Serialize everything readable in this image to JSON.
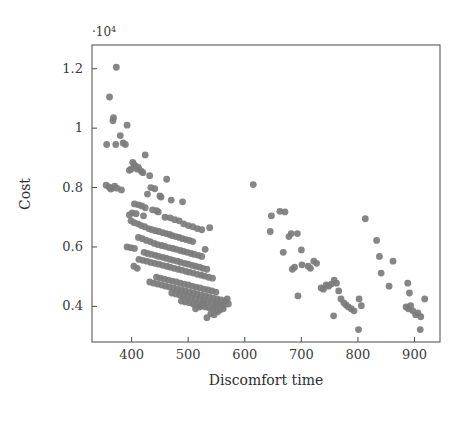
{
  "chart_data": {
    "type": "scatter",
    "title": "",
    "xlabel": "Discomfort time",
    "ylabel": "Cost",
    "y_exponent_label": "·10",
    "y_exponent_power": "4",
    "y_scale_factor": 10000,
    "xlim": [
      330,
      945
    ],
    "ylim": [
      0.28,
      1.28
    ],
    "xticks": [
      400,
      500,
      600,
      700,
      800,
      900
    ],
    "xtick_labels": [
      "400",
      "500",
      "600",
      "700",
      "800",
      "900"
    ],
    "yticks": [
      0.4,
      0.6,
      0.8,
      1,
      1.2
    ],
    "ytick_labels": [
      "0.4",
      "0.6",
      "0.8",
      "1",
      "1.2"
    ],
    "grid": false,
    "legend": false,
    "marker": {
      "shape": "circle",
      "color": "#7c7c7c",
      "radius": 3.4,
      "opacity": 0.92
    },
    "series": [
      {
        "name": "Pareto solutions",
        "points": [
          [
            373,
            1.205
          ],
          [
            361,
            1.105
          ],
          [
            368,
            1.035
          ],
          [
            367,
            1.025
          ],
          [
            392,
            1.01
          ],
          [
            380,
            0.975
          ],
          [
            356,
            0.945
          ],
          [
            372,
            0.945
          ],
          [
            385,
            0.95
          ],
          [
            389,
            0.945
          ],
          [
            424,
            0.91
          ],
          [
            402,
            0.885
          ],
          [
            404,
            0.878
          ],
          [
            407,
            0.872
          ],
          [
            412,
            0.868
          ],
          [
            410,
            0.862
          ],
          [
            399,
            0.862
          ],
          [
            396,
            0.858
          ],
          [
            417,
            0.855
          ],
          [
            420,
            0.85
          ],
          [
            432,
            0.84
          ],
          [
            462,
            0.828
          ],
          [
            355,
            0.808
          ],
          [
            360,
            0.802
          ],
          [
            366,
            0.798
          ],
          [
            370,
            0.805
          ],
          [
            374,
            0.798
          ],
          [
            363,
            0.795
          ],
          [
            382,
            0.792
          ],
          [
            434,
            0.8
          ],
          [
            441,
            0.796
          ],
          [
            615,
            0.81
          ],
          [
            428,
            0.778
          ],
          [
            450,
            0.772
          ],
          [
            452,
            0.768
          ],
          [
            470,
            0.758
          ],
          [
            490,
            0.752
          ],
          [
            405,
            0.745
          ],
          [
            412,
            0.742
          ],
          [
            418,
            0.738
          ],
          [
            424,
            0.732
          ],
          [
            437,
            0.725
          ],
          [
            444,
            0.722
          ],
          [
            447,
            0.718
          ],
          [
            401,
            0.715
          ],
          [
            408,
            0.712
          ],
          [
            396,
            0.708
          ],
          [
            421,
            0.705
          ],
          [
            459,
            0.7
          ],
          [
            468,
            0.698
          ],
          [
            476,
            0.692
          ],
          [
            484,
            0.688
          ],
          [
            492,
            0.678
          ],
          [
            500,
            0.672
          ],
          [
            508,
            0.668
          ],
          [
            516,
            0.662
          ],
          [
            524,
            0.658
          ],
          [
            538,
            0.665
          ],
          [
            647,
            0.705
          ],
          [
            662,
            0.72
          ],
          [
            671,
            0.718
          ],
          [
            813,
            0.695
          ],
          [
            399,
            0.688
          ],
          [
            404,
            0.682
          ],
          [
            411,
            0.678
          ],
          [
            417,
            0.672
          ],
          [
            423,
            0.668
          ],
          [
            430,
            0.662
          ],
          [
            436,
            0.658
          ],
          [
            442,
            0.655
          ],
          [
            448,
            0.652
          ],
          [
            455,
            0.648
          ],
          [
            461,
            0.645
          ],
          [
            467,
            0.642
          ],
          [
            472,
            0.638
          ],
          [
            478,
            0.635
          ],
          [
            484,
            0.632
          ],
          [
            490,
            0.628
          ],
          [
            496,
            0.625
          ],
          [
            502,
            0.622
          ],
          [
            508,
            0.618
          ],
          [
            412,
            0.632
          ],
          [
            419,
            0.628
          ],
          [
            426,
            0.622
          ],
          [
            433,
            0.618
          ],
          [
            440,
            0.612
          ],
          [
            446,
            0.608
          ],
          [
            453,
            0.605
          ],
          [
            459,
            0.602
          ],
          [
            466,
            0.598
          ],
          [
            473,
            0.595
          ],
          [
            479,
            0.592
          ],
          [
            486,
            0.588
          ],
          [
            492,
            0.585
          ],
          [
            498,
            0.582
          ],
          [
            505,
            0.578
          ],
          [
            511,
            0.575
          ],
          [
            518,
            0.572
          ],
          [
            524,
            0.568
          ],
          [
            392,
            0.6
          ],
          [
            398,
            0.598
          ],
          [
            405,
            0.595
          ],
          [
            530,
            0.592
          ],
          [
            645,
            0.652
          ],
          [
            678,
            0.635
          ],
          [
            682,
            0.645
          ],
          [
            668,
            0.582
          ],
          [
            422,
            0.582
          ],
          [
            428,
            0.578
          ],
          [
            435,
            0.575
          ],
          [
            442,
            0.572
          ],
          [
            448,
            0.568
          ],
          [
            455,
            0.565
          ],
          [
            461,
            0.562
          ],
          [
            468,
            0.558
          ],
          [
            474,
            0.555
          ],
          [
            481,
            0.552
          ],
          [
            487,
            0.548
          ],
          [
            494,
            0.545
          ],
          [
            500,
            0.542
          ],
          [
            507,
            0.538
          ],
          [
            513,
            0.535
          ],
          [
            520,
            0.532
          ],
          [
            526,
            0.528
          ],
          [
            533,
            0.525
          ],
          [
            413,
            0.558
          ],
          [
            420,
            0.555
          ],
          [
            427,
            0.552
          ],
          [
            434,
            0.548
          ],
          [
            441,
            0.545
          ],
          [
            448,
            0.542
          ],
          [
            455,
            0.538
          ],
          [
            462,
            0.535
          ],
          [
            468,
            0.532
          ],
          [
            475,
            0.528
          ],
          [
            482,
            0.525
          ],
          [
            489,
            0.522
          ],
          [
            496,
            0.518
          ],
          [
            502,
            0.515
          ],
          [
            509,
            0.512
          ],
          [
            516,
            0.508
          ],
          [
            523,
            0.505
          ],
          [
            529,
            0.502
          ],
          [
            536,
            0.498
          ],
          [
            543,
            0.495
          ],
          [
            404,
            0.535
          ],
          [
            410,
            0.528
          ],
          [
            700,
            0.59
          ],
          [
            722,
            0.552
          ],
          [
            727,
            0.545
          ],
          [
            693,
            0.645
          ],
          [
            701,
            0.54
          ],
          [
            712,
            0.535
          ],
          [
            716,
            0.528
          ],
          [
            688,
            0.532
          ],
          [
            684,
            0.525
          ],
          [
            838,
            0.568
          ],
          [
            862,
            0.552
          ],
          [
            833,
            0.622
          ],
          [
            841,
            0.512
          ],
          [
            444,
            0.498
          ],
          [
            451,
            0.495
          ],
          [
            458,
            0.492
          ],
          [
            465,
            0.488
          ],
          [
            472,
            0.485
          ],
          [
            479,
            0.482
          ],
          [
            486,
            0.478
          ],
          [
            493,
            0.475
          ],
          [
            500,
            0.472
          ],
          [
            507,
            0.468
          ],
          [
            514,
            0.465
          ],
          [
            521,
            0.462
          ],
          [
            528,
            0.458
          ],
          [
            535,
            0.455
          ],
          [
            542,
            0.452
          ],
          [
            549,
            0.448
          ],
          [
            432,
            0.482
          ],
          [
            439,
            0.478
          ],
          [
            446,
            0.475
          ],
          [
            453,
            0.472
          ],
          [
            460,
            0.468
          ],
          [
            467,
            0.465
          ],
          [
            474,
            0.462
          ],
          [
            481,
            0.458
          ],
          [
            488,
            0.455
          ],
          [
            495,
            0.452
          ],
          [
            502,
            0.448
          ],
          [
            509,
            0.445
          ],
          [
            516,
            0.442
          ],
          [
            523,
            0.438
          ],
          [
            530,
            0.435
          ],
          [
            537,
            0.432
          ],
          [
            544,
            0.428
          ],
          [
            551,
            0.425
          ],
          [
            558,
            0.422
          ],
          [
            744,
            0.472
          ],
          [
            748,
            0.468
          ],
          [
            753,
            0.475
          ],
          [
            758,
            0.488
          ],
          [
            762,
            0.478
          ],
          [
            735,
            0.462
          ],
          [
            739,
            0.458
          ],
          [
            855,
            0.468
          ],
          [
            888,
            0.478
          ],
          [
            891,
            0.445
          ],
          [
            694,
            0.435
          ],
          [
            471,
            0.445
          ],
          [
            478,
            0.442
          ],
          [
            485,
            0.438
          ],
          [
            492,
            0.435
          ],
          [
            499,
            0.432
          ],
          [
            506,
            0.428
          ],
          [
            513,
            0.425
          ],
          [
            520,
            0.422
          ],
          [
            527,
            0.418
          ],
          [
            534,
            0.415
          ],
          [
            541,
            0.412
          ],
          [
            548,
            0.408
          ],
          [
            555,
            0.405
          ],
          [
            562,
            0.402
          ],
          [
            569,
            0.425
          ],
          [
            488,
            0.418
          ],
          [
            495,
            0.415
          ],
          [
            502,
            0.412
          ],
          [
            509,
            0.408
          ],
          [
            516,
            0.405
          ],
          [
            523,
            0.402
          ],
          [
            530,
            0.398
          ],
          [
            537,
            0.395
          ],
          [
            544,
            0.392
          ],
          [
            551,
            0.412
          ],
          [
            558,
            0.408
          ],
          [
            565,
            0.418
          ],
          [
            766,
            0.452
          ],
          [
            770,
            0.425
          ],
          [
            775,
            0.412
          ],
          [
            779,
            0.405
          ],
          [
            783,
            0.398
          ],
          [
            788,
            0.392
          ],
          [
            793,
            0.385
          ],
          [
            802,
            0.425
          ],
          [
            806,
            0.402
          ],
          [
            757,
            0.368
          ],
          [
            885,
            0.398
          ],
          [
            889,
            0.392
          ],
          [
            893,
            0.402
          ],
          [
            897,
            0.385
          ],
          [
            902,
            0.372
          ],
          [
            906,
            0.378
          ],
          [
            918,
            0.425
          ],
          [
            911,
            0.365
          ],
          [
            910,
            0.322
          ],
          [
            801,
            0.322
          ],
          [
            533,
            0.362
          ],
          [
            556,
            0.388
          ],
          [
            562,
            0.392
          ],
          [
            571,
            0.408
          ],
          [
            547,
            0.398
          ],
          [
            552,
            0.382
          ],
          [
            540,
            0.375
          ],
          [
            546,
            0.372
          ],
          [
            527,
            0.408
          ],
          [
            520,
            0.398
          ],
          [
            513,
            0.392
          ]
        ]
      }
    ]
  },
  "layout": {
    "plot_left": 92,
    "plot_right": 440,
    "plot_top": 45,
    "plot_bottom": 342
  }
}
